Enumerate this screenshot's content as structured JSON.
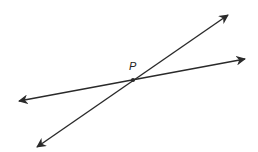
{
  "diagram": {
    "point": {
      "label": "P",
      "x": 133,
      "y": 80,
      "label_x": 129,
      "label_y": 70
    },
    "lines": [
      {
        "name": "steep-line",
        "x1": 37,
        "y1": 147,
        "x2": 228,
        "y2": 15
      },
      {
        "name": "shallow-line",
        "x1": 19,
        "y1": 101,
        "x2": 245,
        "y2": 59
      }
    ],
    "stroke_color": "#2a2a2a",
    "background": "#ffffff"
  }
}
